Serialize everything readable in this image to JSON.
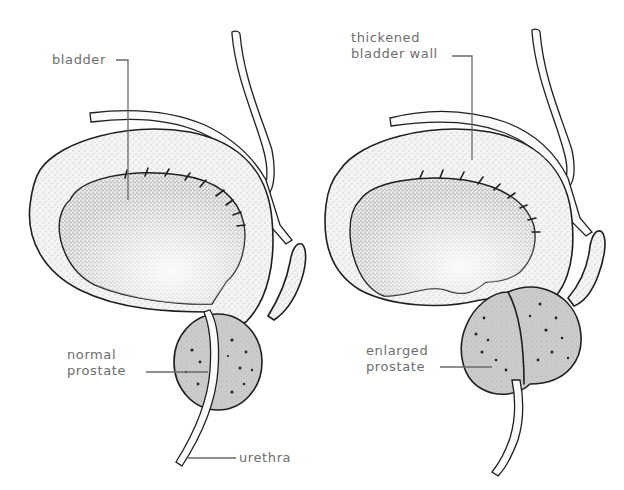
{
  "figure": {
    "panels": [
      {
        "id": "normal",
        "labels": {
          "bladder": "bladder",
          "prostate_line1": "normal",
          "prostate_line2": "prostate",
          "urethra": "urethra"
        }
      },
      {
        "id": "enlarged",
        "labels": {
          "wall_line1": "thickened",
          "wall_line2": "bladder wall",
          "prostate_line1": "enlarged",
          "prostate_line2": "prostate"
        }
      }
    ],
    "colors": {
      "line": "#1f1f1f",
      "label_text": "#6e6e6e",
      "prostate_fill": "#c8c8c8",
      "background": "#ffffff"
    }
  }
}
